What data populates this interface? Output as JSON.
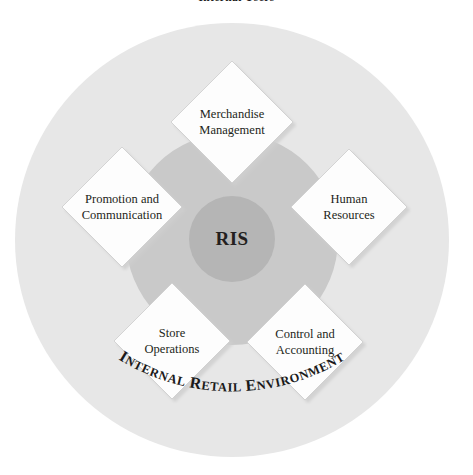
{
  "figure": {
    "title": "Internal Users",
    "center_label": "RIS",
    "outer_ring_label": "INTERNAL RETAIL ENVIRONMENT"
  },
  "colors": {
    "page_background": "#ffffff",
    "outer_circle": "#e7e7e7",
    "middle_circle": "#c9c9c9",
    "inner_circle": "#b5b5b5",
    "diamond_fill": "#fdfdfd",
    "diamond_stroke": "#c8c8c8",
    "shadow": "#b9b9b9",
    "text": "#231f20"
  },
  "nodes": [
    {
      "id": "merchandise-management",
      "line1": "Merchandise",
      "line2": "Management",
      "position": "top",
      "cx": 232,
      "cy": 122,
      "r": 61
    },
    {
      "id": "human-resources",
      "line1": "Human",
      "line2": "Resources",
      "position": "right",
      "cx": 349,
      "cy": 207,
      "r": 58
    },
    {
      "id": "control-and-accounting",
      "line1": "Control and",
      "line2": "Accounting",
      "position": "bottom-right",
      "cx": 305,
      "cy": 342,
      "r": 58
    },
    {
      "id": "store-operations",
      "line1": "Store",
      "line2": "Operations",
      "position": "bottom-left",
      "cx": 172,
      "cy": 341,
      "r": 58
    },
    {
      "id": "promotion-and-communication",
      "line1": "Promotion and",
      "line2": "Communication",
      "position": "left",
      "cx": 122,
      "cy": 207,
      "r": 60
    }
  ],
  "geometry": {
    "outer_circle": {
      "cx": 232,
      "cy": 240,
      "r": 217
    },
    "middle_circle": {
      "cx": 232,
      "cy": 239,
      "r": 106
    },
    "inner_circle": {
      "cx": 232,
      "cy": 239,
      "r": 43
    }
  }
}
